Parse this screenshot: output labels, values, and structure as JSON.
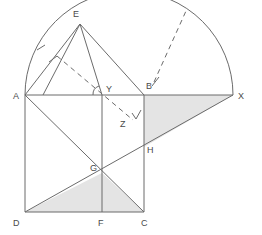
{
  "figure": {
    "stroke_color": "#6b6b6b",
    "shade_color": "#e4e4e4",
    "label_color": "#4a4a4a",
    "background": "#ffffff",
    "width": 262,
    "height": 235
  },
  "labels": {
    "A": "A",
    "B": "B",
    "C": "C",
    "D": "D",
    "E": "E",
    "F": "F",
    "G": "G",
    "H": "H",
    "X": "X",
    "Y": "Y",
    "Z": "Z"
  },
  "points": {
    "A": {
      "x": 25,
      "y": 95
    },
    "B": {
      "x": 144,
      "y": 95
    },
    "C": {
      "x": 144,
      "y": 212
    },
    "D": {
      "x": 25,
      "y": 212
    },
    "E": {
      "x": 80,
      "y": 24
    },
    "F": {
      "x": 102,
      "y": 212
    },
    "G": {
      "x": 102,
      "y": 173
    },
    "H": {
      "x": 144,
      "y": 147
    },
    "X": {
      "x": 233,
      "y": 95
    },
    "Y": {
      "x": 102,
      "y": 95
    },
    "Z": {
      "x": 131,
      "y": 117
    }
  },
  "label_positions": {
    "A": {
      "x": 13,
      "y": 99
    },
    "B": {
      "x": 146,
      "y": 89
    },
    "C": {
      "x": 145,
      "y": 224
    },
    "D": {
      "x": 13,
      "y": 224
    },
    "E": {
      "x": 75,
      "y": 16
    },
    "F": {
      "x": 99,
      "y": 224
    },
    "G": {
      "x": 92,
      "y": 171
    },
    "H": {
      "x": 147,
      "y": 152
    },
    "X": {
      "x": 239,
      "y": 99
    },
    "Y": {
      "x": 108,
      "y": 91
    },
    "Z": {
      "x": 122,
      "y": 126
    }
  },
  "semicircle": {
    "center_x": 129,
    "center_y": 95,
    "radius": 104,
    "description": "semicircle on diameter AX above line AX"
  },
  "solid_segments": [
    {
      "name": "segment-AX",
      "x1": 25,
      "y1": 95,
      "x2": 233,
      "y2": 95
    },
    {
      "name": "segment-AD",
      "x1": 25,
      "y1": 95,
      "x2": 25,
      "y2": 212
    },
    {
      "name": "segment-DC",
      "x1": 25,
      "y1": 212,
      "x2": 144,
      "y2": 212
    },
    {
      "name": "segment-BC",
      "x1": 144,
      "y1": 95,
      "x2": 144,
      "y2": 212
    },
    {
      "name": "segment-YF",
      "x1": 102,
      "y1": 95,
      "x2": 102,
      "y2": 212
    },
    {
      "name": "segment-AC",
      "x1": 25,
      "y1": 95,
      "x2": 144,
      "y2": 212
    },
    {
      "name": "segment-DX",
      "x1": 25,
      "y1": 212,
      "x2": 233,
      "y2": 95
    },
    {
      "name": "segment-AE",
      "x1": 25,
      "y1": 95,
      "x2": 80,
      "y2": 24
    },
    {
      "name": "segment-EY",
      "x1": 80,
      "y1": 24,
      "x2": 102,
      "y2": 95
    },
    {
      "name": "segment-EB",
      "x1": 80,
      "y1": 24,
      "x2": 144,
      "y2": 95
    },
    {
      "name": "segment-EA2",
      "x1": 80,
      "y1": 24,
      "x2": 43,
      "y2": 95
    }
  ],
  "dashed_segments": [
    {
      "name": "dashed-E-through-Y-to-Z",
      "x1": 57,
      "y1": 56,
      "x2": 133,
      "y2": 120
    },
    {
      "name": "dashed-B-to-arc-upper-right",
      "x1": 154,
      "y1": 82,
      "x2": 186,
      "y2": 11
    }
  ],
  "tick_marks": [
    {
      "name": "tick-on-arc-AE",
      "x": 41,
      "y": 48
    },
    {
      "name": "tick-on-segment-AE",
      "x": 53,
      "y": 59
    },
    {
      "name": "tick-near-B",
      "x": 155,
      "y": 82
    }
  ],
  "right_angle_marker": {
    "name": "right-angle-at-Y",
    "x": 102,
    "y": 95,
    "radius": 9
  },
  "arrow_marker": {
    "name": "arrow-at-Z",
    "x": 137,
    "y": 117
  },
  "shaded_regions": [
    {
      "name": "shaded-triangle-BXH",
      "points": "144,95 233,95 144,147"
    },
    {
      "name": "shaded-triangle-DFG",
      "points": "25,212 144,212 102,173"
    }
  ]
}
